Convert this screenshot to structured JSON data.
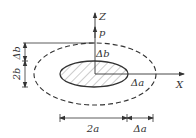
{
  "diagram": {
    "axes": {
      "z_label": "Z",
      "x_label": "X",
      "load_label": "p"
    },
    "inner_ellipse": {
      "semi_axis_x": "a",
      "semi_axis_z": "b",
      "fill": "hatched"
    },
    "outer_ellipse": {
      "style": "dashed"
    },
    "labels": {
      "delta_b_center": "Δb",
      "delta_a_right": "Δa",
      "dim_left_top": "Δb",
      "dim_left_bottom": "2b",
      "dim_bottom_left": "2a",
      "dim_bottom_right": "Δa"
    },
    "colors": {
      "stroke": "#333333",
      "background": "#ffffff"
    }
  }
}
